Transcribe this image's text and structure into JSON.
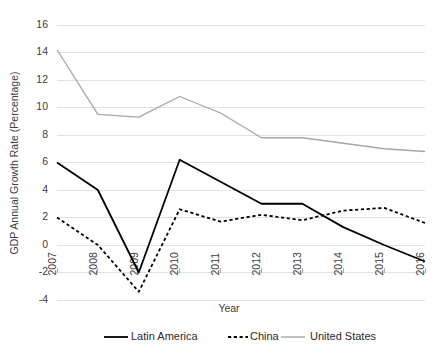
{
  "chart_data": {
    "type": "line",
    "title": "",
    "xlabel": "Year",
    "ylabel": "GDP Annual Growth Rate (Percentage)",
    "categories": [
      "2007",
      "2008",
      "2009",
      "2010",
      "2011",
      "2012",
      "2013",
      "2014",
      "2015",
      "2016"
    ],
    "x": [
      2007,
      2008,
      2009,
      2010,
      2011,
      2012,
      2013,
      2014,
      2015,
      2016
    ],
    "ylim": [
      -4,
      16
    ],
    "ytick_step": 2,
    "yticks": [
      "16",
      "14",
      "12",
      "10",
      "8",
      "6",
      "4",
      "2",
      "0",
      "-2",
      "-4"
    ],
    "ytick_values": [
      16,
      14,
      12,
      10,
      8,
      6,
      4,
      2,
      0,
      -2,
      -4
    ],
    "grid": true,
    "legend_position": "bottom",
    "series": [
      {
        "name": "Latin America",
        "style": "solid",
        "color": "#000000",
        "values": [
          6.0,
          4.0,
          -2.0,
          6.2,
          4.6,
          3.0,
          3.0,
          1.3,
          0.0,
          -1.2
        ]
      },
      {
        "name": "China",
        "style": "dotted",
        "color": "#000000",
        "values": [
          2.0,
          0.0,
          -3.4,
          2.6,
          1.7,
          2.2,
          1.8,
          2.5,
          2.7,
          1.6
        ]
      },
      {
        "name": "United States",
        "style": "solid",
        "color": "#a6a6a6",
        "values": [
          14.2,
          9.5,
          9.3,
          10.8,
          9.6,
          7.8,
          7.8,
          7.4,
          7.0,
          6.8
        ]
      }
    ]
  },
  "legend": {
    "items": [
      {
        "label": "Latin America"
      },
      {
        "label": "China"
      },
      {
        "label": "United States"
      }
    ]
  },
  "axes": {
    "x_title": "Year",
    "y_title": "GDP Annual Growth Rate (Percentage)"
  },
  "colors": {
    "latin_america": "#000000",
    "china": "#000000",
    "united_states": "#a6a6a6",
    "gridline": "#d9d9d9",
    "text": "#3d3d3d",
    "background": "#ffffff"
  }
}
